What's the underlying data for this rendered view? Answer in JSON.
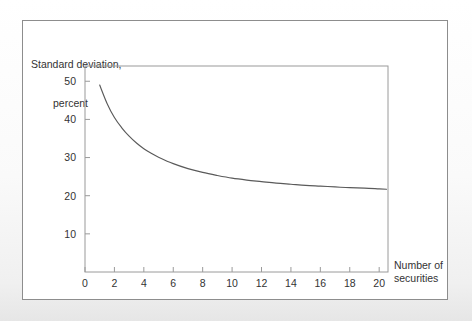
{
  "figure": {
    "background_color": "#ffffff",
    "frame_color": "#8d8d8d",
    "axis_color": "#9a9a9a",
    "curve_color": "#5a5a5a",
    "text_color": "#333333"
  },
  "chart_data": {
    "type": "line",
    "title": "",
    "subtitle": "",
    "xlabel_line1": "Number of",
    "xlabel_line2": "securities",
    "ylabel_line1": "Standard deviation,",
    "ylabel_line2": "percent",
    "xlim": [
      0,
      20.6
    ],
    "ylim": [
      0,
      54
    ],
    "xticks": [
      0,
      2,
      4,
      6,
      8,
      10,
      12,
      14,
      16,
      18,
      20
    ],
    "xtick_labels": [
      "0",
      "2",
      "4",
      "6",
      "8",
      "10",
      "12",
      "14",
      "16",
      "18",
      "20"
    ],
    "yticks": [
      10,
      20,
      30,
      40,
      50
    ],
    "ytick_labels": [
      "10",
      "20",
      "30",
      "40",
      "50"
    ],
    "grid": false,
    "legend": null,
    "annotations": [],
    "series": [
      {
        "name": "Portfolio standard deviation",
        "x": [
          1,
          1.5,
          2,
          2.5,
          3,
          3.5,
          4,
          4.5,
          5,
          6,
          7,
          8,
          9,
          10,
          11,
          12,
          13,
          14,
          15,
          16,
          17,
          18,
          19,
          20,
          20.5
        ],
        "values": [
          49.0,
          44.2,
          40.5,
          37.8,
          35.6,
          33.8,
          32.3,
          31.1,
          30.1,
          28.4,
          27.1,
          26.1,
          25.3,
          24.6,
          24.1,
          23.7,
          23.3,
          23.0,
          22.7,
          22.5,
          22.3,
          22.1,
          22.0,
          21.8,
          21.7
        ]
      }
    ]
  }
}
